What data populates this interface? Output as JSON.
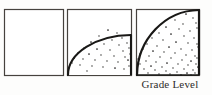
{
  "figure": {
    "caption": "Grade Level",
    "background_color": "#fdfdfc",
    "ink_color": "#1b1a19",
    "frame_color": "#3a3734",
    "panel_count": 3,
    "panels": [
      {
        "index": 1,
        "name": "panel-empty",
        "x": 4,
        "y": 9,
        "width": 60,
        "height": 67,
        "arc": null,
        "stipple": false,
        "stipple_count": 0,
        "border_weight": 1.2
      },
      {
        "index": 2,
        "name": "panel-partial-fill",
        "x": 67,
        "y": 9,
        "width": 65,
        "height": 67,
        "arc": {
          "center_x": 67,
          "center_y": 76,
          "radius_x": 65,
          "radius_y": 40,
          "fill_label": "quarter-circle partial",
          "stroke_weight": 2.2
        },
        "stipple": true,
        "stipple_count": 34,
        "border_weight": 1.2
      },
      {
        "index": 3,
        "name": "panel-full-fill",
        "x": 136,
        "y": 9,
        "width": 64,
        "height": 67,
        "arc": {
          "center_x": 136,
          "center_y": 76,
          "radius_x": 64,
          "radius_y": 67,
          "fill_label": "quarter-circle full",
          "stroke_weight": 2.2
        },
        "stipple": true,
        "stipple_count": 62,
        "border_weight": 1.2
      }
    ],
    "stipple_dots_panel2": [
      [
        108,
        30
      ],
      [
        117,
        33
      ],
      [
        99,
        36
      ],
      [
        112,
        40
      ],
      [
        122,
        38
      ],
      [
        91,
        42
      ],
      [
        104,
        44
      ],
      [
        119,
        45
      ],
      [
        127,
        43
      ],
      [
        84,
        48
      ],
      [
        97,
        49
      ],
      [
        110,
        50
      ],
      [
        123,
        51
      ],
      [
        129,
        48
      ],
      [
        78,
        53
      ],
      [
        89,
        54
      ],
      [
        101,
        55
      ],
      [
        114,
        56
      ],
      [
        125,
        57
      ],
      [
        130,
        54
      ],
      [
        74,
        58
      ],
      [
        83,
        59
      ],
      [
        95,
        60
      ],
      [
        107,
        61
      ],
      [
        118,
        62
      ],
      [
        128,
        60
      ],
      [
        72,
        63
      ],
      [
        80,
        65
      ],
      [
        92,
        66
      ],
      [
        103,
        67
      ],
      [
        115,
        68
      ],
      [
        124,
        69
      ],
      [
        129,
        66
      ],
      [
        87,
        71
      ]
    ],
    "stipple_dots_panel3": [
      [
        186,
        14
      ],
      [
        193,
        18
      ],
      [
        175,
        20
      ],
      [
        183,
        24
      ],
      [
        196,
        23
      ],
      [
        166,
        27
      ],
      [
        179,
        29
      ],
      [
        190,
        31
      ],
      [
        197,
        28
      ],
      [
        159,
        33
      ],
      [
        171,
        34
      ],
      [
        184,
        36
      ],
      [
        194,
        38
      ],
      [
        152,
        38
      ],
      [
        163,
        40
      ],
      [
        176,
        42
      ],
      [
        188,
        43
      ],
      [
        197,
        44
      ],
      [
        147,
        44
      ],
      [
        157,
        46
      ],
      [
        169,
        47
      ],
      [
        181,
        49
      ],
      [
        192,
        50
      ],
      [
        198,
        47
      ],
      [
        143,
        49
      ],
      [
        153,
        51
      ],
      [
        164,
        52
      ],
      [
        175,
        53
      ],
      [
        186,
        55
      ],
      [
        195,
        56
      ],
      [
        140,
        54
      ],
      [
        149,
        56
      ],
      [
        160,
        57
      ],
      [
        171,
        58
      ],
      [
        182,
        60
      ],
      [
        191,
        61
      ],
      [
        197,
        58
      ],
      [
        138,
        59
      ],
      [
        146,
        61
      ],
      [
        156,
        62
      ],
      [
        167,
        63
      ],
      [
        178,
        64
      ],
      [
        188,
        65
      ],
      [
        196,
        64
      ],
      [
        140,
        64
      ],
      [
        151,
        66
      ],
      [
        162,
        67
      ],
      [
        173,
        68
      ],
      [
        184,
        69
      ],
      [
        193,
        70
      ],
      [
        198,
        67
      ],
      [
        144,
        69
      ],
      [
        155,
        70
      ],
      [
        166,
        71
      ],
      [
        177,
        72
      ],
      [
        187,
        73
      ],
      [
        195,
        73
      ],
      [
        148,
        73
      ],
      [
        159,
        74
      ],
      [
        170,
        74
      ],
      [
        181,
        75
      ],
      [
        191,
        75
      ]
    ]
  }
}
